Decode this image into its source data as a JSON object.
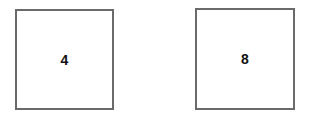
{
  "boxes": [
    {
      "label": "4"
    },
    {
      "label": "8"
    }
  ],
  "colors": {
    "border": "#6a6a6a",
    "text": "#111111",
    "background": "#ffffff"
  }
}
